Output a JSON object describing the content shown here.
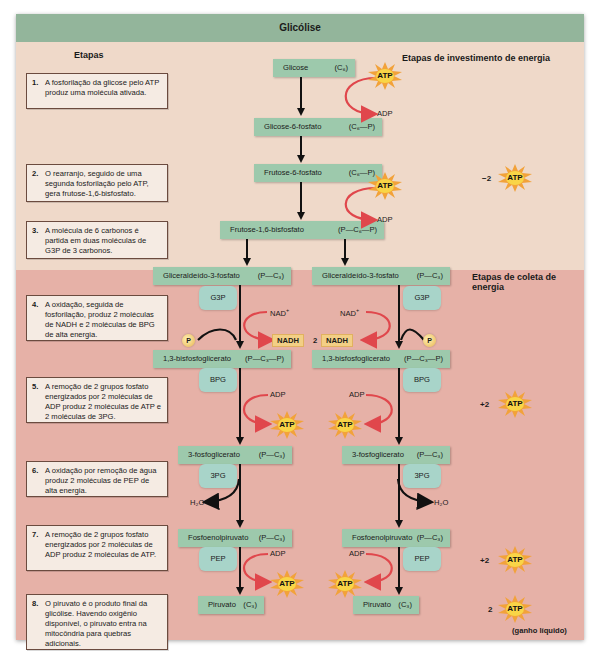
{
  "diagram": {
    "title": "Glicólise",
    "headings": {
      "stages": "Etapas",
      "investment": "Etapas de investimento de energia",
      "harvest": "Etapas de coleta de energia"
    },
    "steps": [
      {
        "num": "1.",
        "text": "A fosforilação da glicose pelo ATP produz uma molécula ativada."
      },
      {
        "num": "2.",
        "text": "O rearranjo, seguido de uma segunda fosforilação pelo ATP, gera frutose-1,6-bisfosfato."
      },
      {
        "num": "3.",
        "text": "A molécula de 6 carbonos é partida em duas moléculas de G3P de 3 carbonos."
      },
      {
        "num": "4.",
        "text": "A oxidação, seguida de fosforilação, produz 2 moléculas de NADH e 2 moléculas de BPG de alta energia."
      },
      {
        "num": "5.",
        "text": "A remoção de 2 grupos fosfato energizados por 2 moléculas de ADP produz 2 moléculas de ATP e 2 moléculas de 3PG."
      },
      {
        "num": "6.",
        "text": "A oxidação por remoção de água produz 2 moléculas de PEP de alta energia."
      },
      {
        "num": "7.",
        "text": "A remoção de 2 grupos fosfato energizados por 2 moléculas de ADP produz 2 moléculas de ATP."
      },
      {
        "num": "8.",
        "text": "O piruvato é o produto final da glicólise. Havendo oxigênio disponível, o piruvato entra na mitocôndria para quebras adicionais."
      }
    ],
    "molecules": {
      "glicose": {
        "name": "Glicose",
        "formula": "(C₆)"
      },
      "g6p": {
        "name": "Glicose-6-fosfato",
        "formula": "(C₆—P)"
      },
      "f6p": {
        "name": "Frutose-6-fosfato",
        "formula": "(C₆—P)"
      },
      "f16bp": {
        "name": "Frutose-1,6-bisfosfato",
        "formula": "(P—C₆—P)"
      },
      "g3p": {
        "name": "Gliceraldeído-3-fosfato",
        "formula": "(P—C₃)",
        "abbr": "G3P"
      },
      "bpg": {
        "name": "1,3-bisfosfoglicerato",
        "formula": "(P—C₃—P)",
        "abbr": "BPG"
      },
      "pg3": {
        "name": "3-fosfoglicerato",
        "formula": "(P—C₃)",
        "abbr": "3PG"
      },
      "pep": {
        "name": "Fosfoenolpiruvato",
        "formula": "(P—C₃)",
        "abbr": "PEP"
      },
      "piruvato": {
        "name": "Piruvato",
        "formula": "(C₃)"
      }
    },
    "cofactors": {
      "atp": "ATP",
      "adp": "ADP",
      "nad": "NAD",
      "nad_sup": "+",
      "nadh": "NADH",
      "nadh_count": "2",
      "phosphate": "P",
      "water": "H₂O"
    },
    "net": {
      "investment": "−2",
      "harvest_1": "+2",
      "harvest_2": "+2",
      "total": "2",
      "total_label": "(ganho líquido)"
    },
    "colors": {
      "title_bar": "#93b59b",
      "investment_bg": "#efd9c9",
      "harvest_bg": "#e6b1a7",
      "molecule_box": "#9dc9ac",
      "abbr_box": "#a8d4c9",
      "arrow_red": "#e0474c",
      "atp_burst": "#f2a23a"
    }
  }
}
